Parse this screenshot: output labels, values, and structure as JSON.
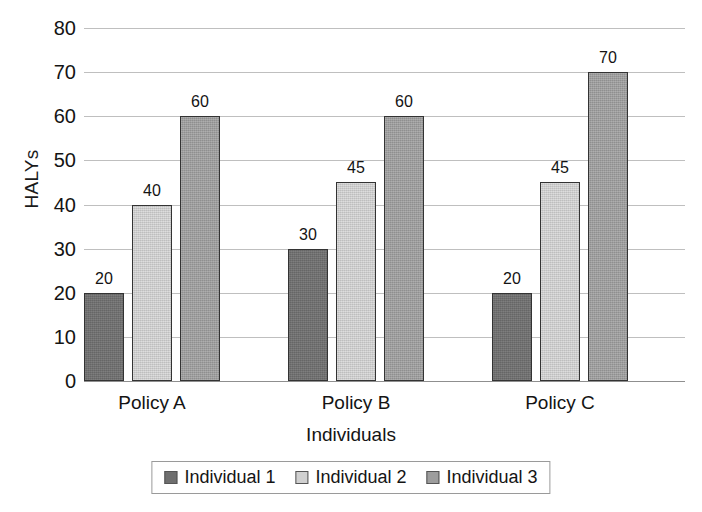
{
  "chart_data": {
    "type": "bar",
    "title": "",
    "xlabel": "Individuals",
    "ylabel": "HALYs",
    "categories": [
      "Policy A",
      "Policy B",
      "Policy C"
    ],
    "series": [
      {
        "name": "Individual 1",
        "values": [
          20,
          30,
          20
        ],
        "color": "#6f6f6f"
      },
      {
        "name": "Individual 2",
        "values": [
          40,
          45,
          45
        ],
        "color": "#d0d0d0"
      },
      {
        "name": "Individual 3",
        "values": [
          60,
          60,
          70
        ],
        "color": "#9d9d9d"
      }
    ],
    "ylim": [
      0,
      80
    ],
    "yticks": [
      0,
      10,
      20,
      30,
      40,
      50,
      60,
      70,
      80
    ],
    "grid": true,
    "data_labels": true,
    "legend_position": "bottom"
  },
  "axes": {
    "y_title": "HALYs",
    "x_title": "Individuals",
    "y_tick_labels": [
      "80",
      "70",
      "60",
      "50",
      "40",
      "30",
      "20",
      "10",
      "0"
    ]
  },
  "legend": {
    "entries": [
      "Individual 1",
      "Individual 2",
      "Individual 3"
    ]
  }
}
